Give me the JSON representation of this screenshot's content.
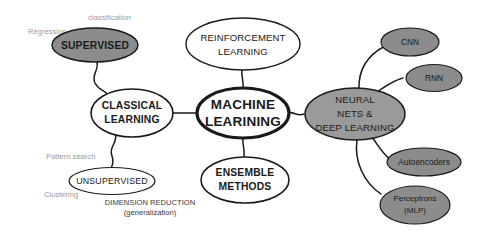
{
  "diagram": {
    "type": "mind-map",
    "colors": {
      "background": "#ffffff",
      "node_stroke": "#1a1a1a",
      "node_white_fill": "#ffffff",
      "node_gray_fill": "#8c8c8c",
      "node_gray_fill_light": "#9a9a9a",
      "annotation_gray": "#9b9b9b",
      "text_dark": "#1a1a1a"
    },
    "root": {
      "id": "machine-learning",
      "line1": "MACHINE",
      "line2": "LEARINING",
      "fill": "white",
      "emphasis": "bold-outline"
    },
    "branches": [
      {
        "id": "classical-learning",
        "line1": "CLASSICAL",
        "line2": "LEARNING",
        "fill": "white"
      },
      {
        "id": "reinforcement-learning",
        "line1": "REINFORCEMENT",
        "line2": "LEARNING",
        "fill": "white"
      },
      {
        "id": "ensemble-methods",
        "line1": "ENSEMBLE",
        "line2": "METHODS",
        "fill": "white"
      },
      {
        "id": "neural-nets-deep-learning",
        "line1": "NEURAL",
        "line2": "NETS &",
        "line3": "DEEP LEARNING",
        "fill": "gray"
      }
    ],
    "classical_children": [
      {
        "id": "supervised",
        "label": "SUPERVISED",
        "fill": "gray"
      },
      {
        "id": "unsupervised",
        "label": "UNSUPERVISED",
        "fill": "white"
      }
    ],
    "neural_children": [
      {
        "id": "cnn",
        "label": "CNN",
        "fill": "gray"
      },
      {
        "id": "rnn",
        "label": "RNN",
        "fill": "gray"
      },
      {
        "id": "autoencoders",
        "label": "Autoencoders",
        "fill": "gray"
      },
      {
        "id": "perceptrons",
        "line1": "Perceptrons",
        "line2": "(MLP)",
        "fill": "gray"
      }
    ],
    "annotations": [
      {
        "id": "classification",
        "text": "classification",
        "style": "gray"
      },
      {
        "id": "regression",
        "text": "Regression",
        "style": "gray"
      },
      {
        "id": "pattern-search",
        "text": "Pattern search",
        "style": "gray"
      },
      {
        "id": "clustering",
        "text": "Clustering",
        "style": "gray"
      },
      {
        "id": "dimension-reduction",
        "text": "DIMENSION REDUCTION",
        "style": "dark"
      },
      {
        "id": "generalization",
        "text": "(generalization)",
        "style": "dark"
      }
    ]
  }
}
